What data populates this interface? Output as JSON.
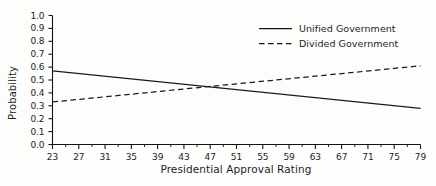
{
  "chart_data": {
    "type": "line",
    "title": "",
    "xlabel": "Presidential Approval Rating",
    "ylabel": "Probability",
    "xlim": [
      23,
      79
    ],
    "ylim": [
      0.0,
      1.0
    ],
    "grid": false,
    "legend_position": "upper right",
    "x_major_ticks": [
      23,
      27,
      31,
      35,
      39,
      43,
      47,
      51,
      55,
      59,
      63,
      67,
      71,
      75,
      79
    ],
    "x_minor_ticks": [
      25,
      29,
      33,
      37,
      41,
      45,
      49,
      53,
      57,
      61,
      65,
      69,
      73,
      77
    ],
    "x_tick_labels": [
      "23",
      "27",
      "31",
      "35",
      "39",
      "43",
      "47",
      "51",
      "55",
      "59",
      "63",
      "67",
      "71",
      "75",
      "79"
    ],
    "y_ticks": [
      0.0,
      0.1,
      0.2,
      0.3,
      0.4,
      0.5,
      0.6,
      0.7,
      0.8,
      0.9,
      1.0
    ],
    "y_tick_labels": [
      "0.0",
      "0.1",
      "0.2",
      "0.3",
      "0.4",
      "0.5",
      "0.6",
      "0.7",
      "0.8",
      "0.9",
      "1.0"
    ],
    "x": [
      23,
      79
    ],
    "series": [
      {
        "name": "Unified Government",
        "style": "solid",
        "color": "#1a1a1a",
        "values": [
          0.57,
          0.28
        ]
      },
      {
        "name": "Divided Government",
        "style": "dashed",
        "color": "#1a1a1a",
        "values": [
          0.33,
          0.61
        ]
      }
    ],
    "intersection": {
      "x": 46.5,
      "y": 0.44
    }
  },
  "legend": {
    "items": [
      {
        "label": "Unified Government",
        "style": "solid"
      },
      {
        "label": "Divided Government",
        "style": "dashed"
      }
    ]
  }
}
